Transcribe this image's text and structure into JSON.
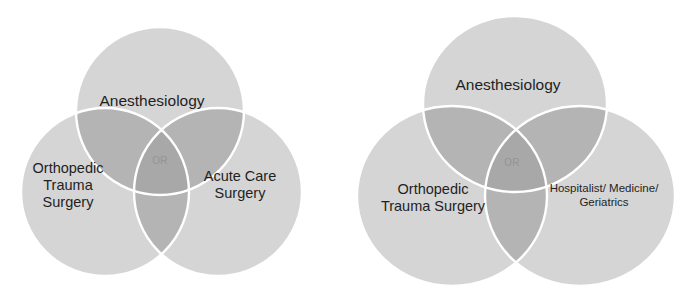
{
  "figure": {
    "background_color": "#ffffff",
    "diagram_count": 2
  },
  "palette": {
    "circle_fill": "#d5d5d5",
    "overlap_two": "#b4b4b4",
    "overlap_three": "#a8a8a8",
    "stroke": "#ffffff",
    "label_color": "#1f1f1f",
    "center_label_color": "#8d8d8d"
  },
  "diagrams": [
    {
      "id": "left",
      "name": "acute-care-surgery-venn",
      "circles": [
        {
          "key": "top",
          "label": "Anesthesiology"
        },
        {
          "key": "left",
          "label": "Orthopedic\nTrauma\nSurgery"
        },
        {
          "key": "right",
          "label": "Acute Care\nSurgery"
        }
      ],
      "center_label": "OR"
    },
    {
      "id": "right",
      "name": "hospitalist-medicine-venn",
      "circles": [
        {
          "key": "top",
          "label": "Anesthesiology"
        },
        {
          "key": "left",
          "label": "Orthopedic\nTrauma Surgery"
        },
        {
          "key": "right",
          "label": "Hospitalist/ Medicine/\nGeriatrics"
        }
      ],
      "center_label": "OR"
    }
  ]
}
